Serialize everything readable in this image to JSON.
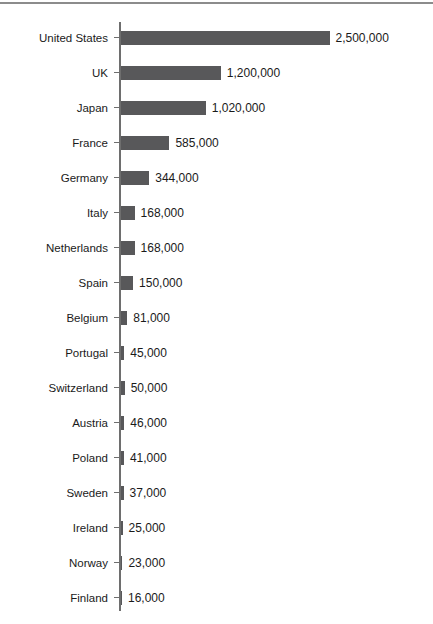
{
  "chart_data": {
    "type": "bar",
    "orientation": "horizontal",
    "title": "",
    "xlabel": "",
    "ylabel": "",
    "xlim": [
      0,
      2500000
    ],
    "grid": false,
    "legend": false,
    "categories": [
      "United States",
      "UK",
      "Japan",
      "France",
      "Germany",
      "Italy",
      "Netherlands",
      "Spain",
      "Belgium",
      "Portugal",
      "Switzerland",
      "Austria",
      "Poland",
      "Sweden",
      "Ireland",
      "Norway",
      "Finland"
    ],
    "values": [
      2500000,
      1200000,
      1020000,
      585000,
      344000,
      168000,
      168000,
      150000,
      81000,
      45000,
      50000,
      46000,
      41000,
      37000,
      25000,
      23000,
      16000
    ],
    "value_labels": [
      "2,500,000",
      "1,200,000",
      "1,020,000",
      "585,000",
      "344,000",
      "168,000",
      "168,000",
      "150,000",
      "81,000",
      "45,000",
      "50,000",
      "46,000",
      "41,000",
      "37,000",
      "25,000",
      "23,000",
      "16,000"
    ]
  },
  "colors": {
    "bar": "#58585a",
    "axis": "#6e6e6e",
    "text": "#1a1a1a",
    "divider": "#8c8c8c",
    "background": "#ffffff"
  }
}
